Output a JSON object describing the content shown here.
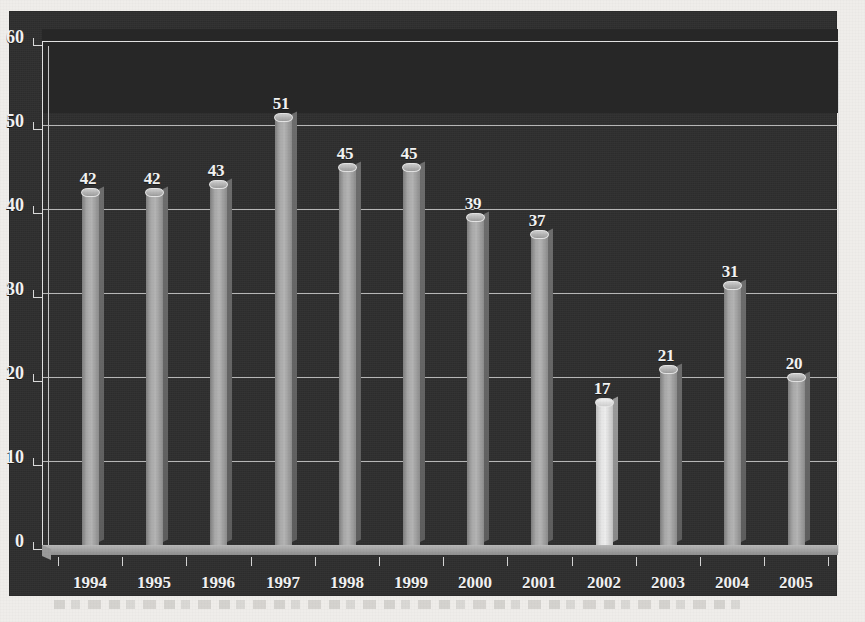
{
  "chart_data": {
    "type": "bar",
    "title": "",
    "subtitle": "",
    "xlabel": "",
    "ylabel": "",
    "categories": [
      "1994",
      "1995",
      "1996",
      "1997",
      "1998",
      "1999",
      "2000",
      "2001",
      "2002",
      "2003",
      "2004",
      "2005"
    ],
    "values": [
      42,
      42,
      43,
      51,
      45,
      45,
      39,
      37,
      17,
      21,
      31,
      20
    ],
    "data_labels": [
      "42",
      "42",
      "43",
      "51",
      "45",
      "45",
      "39",
      "37",
      "17",
      "21",
      "31",
      "20"
    ],
    "ylim": [
      0,
      60
    ],
    "ytick_labels": [
      "0",
      "10",
      "20",
      "30",
      "40",
      "50",
      "60"
    ],
    "ytick_values": [
      0,
      10,
      20,
      30,
      40,
      50,
      60
    ],
    "grid": true,
    "legend": null,
    "legend_position": "none",
    "highlight_category": "2002",
    "series": [
      {
        "name": "values",
        "values": [
          42,
          42,
          43,
          51,
          45,
          45,
          39,
          37,
          17,
          21,
          31,
          20
        ]
      }
    ],
    "style": {
      "panel_background": "#2f2f2f",
      "upper_band_background": "#272727",
      "grid_color": "#cfcfcf",
      "bar_color": "#a8a8a8",
      "highlight_bar_color": "#ededed",
      "text_color": "#f3f3f3",
      "page_background": "#efedea"
    }
  },
  "figure": {
    "render_style": "3d-column-chart-scanned"
  }
}
